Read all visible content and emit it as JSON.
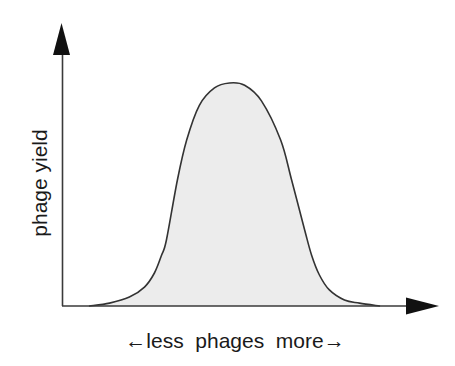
{
  "chart_data": {
    "type": "area",
    "title": "",
    "xlabel": "←less  phages  more→",
    "ylabel": "phage yield",
    "xlim": [
      0,
      10.9
    ],
    "ylim": [
      0,
      1.265
    ],
    "grid": false,
    "legend": null,
    "x_ticks": [],
    "y_ticks": [],
    "series": [
      {
        "name": "phage yield",
        "fill": "#ececec",
        "stroke": "#333333",
        "points": [
          [
            0.79,
            0.0
          ],
          [
            1.37,
            0.013
          ],
          [
            1.95,
            0.04
          ],
          [
            2.39,
            0.085
          ],
          [
            2.68,
            0.148
          ],
          [
            2.89,
            0.229
          ],
          [
            3.03,
            0.296
          ],
          [
            3.35,
            0.565
          ],
          [
            3.62,
            0.744
          ],
          [
            3.99,
            0.9
          ],
          [
            4.43,
            0.978
          ],
          [
            4.87,
            1.0
          ],
          [
            5.31,
            0.99
          ],
          [
            5.8,
            0.92
          ],
          [
            6.36,
            0.744
          ],
          [
            6.68,
            0.565
          ],
          [
            7.06,
            0.341
          ],
          [
            7.26,
            0.229
          ],
          [
            7.49,
            0.139
          ],
          [
            7.78,
            0.072
          ],
          [
            8.22,
            0.027
          ],
          [
            8.66,
            0.013
          ],
          [
            9.24,
            0.0
          ]
        ]
      }
    ]
  }
}
